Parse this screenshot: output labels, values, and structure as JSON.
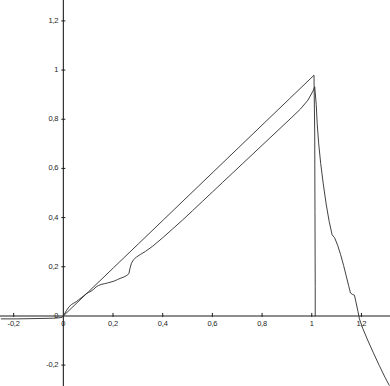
{
  "chart_data": {
    "type": "line",
    "title": "",
    "subtitle": "",
    "xlabel": "",
    "ylabel": "",
    "xlim": [
      -0.255,
      1.315
    ],
    "ylim": [
      -0.285,
      1.285
    ],
    "grid": false,
    "legend": null,
    "decimal_separator": ",",
    "x_ticks": [
      -0.2,
      0,
      0.2,
      0.4,
      0.6,
      0.8,
      1,
      1.2
    ],
    "x_tick_labels": [
      "-0,2",
      "0",
      "0,2",
      "0,4",
      "0,6",
      "0,8",
      "1",
      "1,2"
    ],
    "y_ticks": [
      -0.2,
      0,
      0.2,
      0.4,
      0.6,
      0.8,
      1,
      1.2
    ],
    "y_tick_labels": [
      "-0,2",
      "0",
      "0,2",
      "0,4",
      "0,6",
      "0,8",
      "1",
      "1,2"
    ],
    "series": [
      {
        "name": "reference-line",
        "color": "#2b2b2b",
        "width": 0.9,
        "points": [
          [
            0,
            0
          ],
          [
            0.101,
            0.098
          ],
          [
            0.202,
            0.196
          ],
          [
            0.303,
            0.294
          ],
          [
            0.404,
            0.392
          ],
          [
            0.505,
            0.49
          ],
          [
            0.606,
            0.588
          ],
          [
            0.707,
            0.686
          ],
          [
            0.808,
            0.784
          ],
          [
            0.909,
            0.882
          ],
          [
            1.009,
            0.979
          ],
          [
            1.012,
            0.74
          ],
          [
            1.013,
            0.42
          ],
          [
            1.014,
            0.12
          ],
          [
            1.014,
            0.0
          ]
        ]
      },
      {
        "name": "empirical-curve",
        "color": "#2b2b2b",
        "width": 0.9,
        "points": [
          [
            -0.25,
            -0.012
          ],
          [
            -0.19,
            -0.012
          ],
          [
            -0.13,
            -0.011
          ],
          [
            -0.07,
            -0.01
          ],
          [
            -0.03,
            -0.009
          ],
          [
            -0.005,
            -0.006
          ],
          [
            0.0,
            0.0
          ],
          [
            0.012,
            0.021
          ],
          [
            0.022,
            0.036
          ],
          [
            0.032,
            0.046
          ],
          [
            0.042,
            0.052
          ],
          [
            0.052,
            0.058
          ],
          [
            0.062,
            0.066
          ],
          [
            0.072,
            0.074
          ],
          [
            0.082,
            0.082
          ],
          [
            0.092,
            0.09
          ],
          [
            0.102,
            0.096
          ],
          [
            0.112,
            0.101
          ],
          [
            0.122,
            0.108
          ],
          [
            0.132,
            0.118
          ],
          [
            0.142,
            0.124
          ],
          [
            0.152,
            0.128
          ],
          [
            0.165,
            0.131
          ],
          [
            0.178,
            0.134
          ],
          [
            0.192,
            0.138
          ],
          [
            0.205,
            0.142
          ],
          [
            0.218,
            0.148
          ],
          [
            0.232,
            0.154
          ],
          [
            0.245,
            0.159
          ],
          [
            0.256,
            0.165
          ],
          [
            0.264,
            0.172
          ],
          [
            0.268,
            0.192
          ],
          [
            0.274,
            0.214
          ],
          [
            0.282,
            0.228
          ],
          [
            0.295,
            0.24
          ],
          [
            0.31,
            0.25
          ],
          [
            0.33,
            0.262
          ],
          [
            0.36,
            0.284
          ],
          [
            0.4,
            0.318
          ],
          [
            0.44,
            0.354
          ],
          [
            0.48,
            0.39
          ],
          [
            0.52,
            0.428
          ],
          [
            0.56,
            0.466
          ],
          [
            0.6,
            0.504
          ],
          [
            0.64,
            0.542
          ],
          [
            0.68,
            0.58
          ],
          [
            0.72,
            0.618
          ],
          [
            0.76,
            0.656
          ],
          [
            0.8,
            0.694
          ],
          [
            0.84,
            0.732
          ],
          [
            0.88,
            0.77
          ],
          [
            0.92,
            0.808
          ],
          [
            0.955,
            0.842
          ],
          [
            0.985,
            0.878
          ],
          [
            1.005,
            0.915
          ],
          [
            1.012,
            0.932
          ],
          [
            1.018,
            0.86
          ],
          [
            1.022,
            0.78
          ],
          [
            1.028,
            0.7
          ],
          [
            1.036,
            0.62
          ],
          [
            1.046,
            0.54
          ],
          [
            1.058,
            0.455
          ],
          [
            1.07,
            0.385
          ],
          [
            1.082,
            0.33
          ],
          [
            1.092,
            0.318
          ],
          [
            1.104,
            0.288
          ],
          [
            1.116,
            0.25
          ],
          [
            1.128,
            0.206
          ],
          [
            1.138,
            0.166
          ],
          [
            1.148,
            0.125
          ],
          [
            1.156,
            0.093
          ],
          [
            1.163,
            0.088
          ],
          [
            1.172,
            0.084
          ],
          [
            1.178,
            0.056
          ],
          [
            1.186,
            0.018
          ],
          [
            1.192,
            -0.012
          ],
          [
            1.205,
            -0.05
          ],
          [
            1.225,
            -0.098
          ],
          [
            1.248,
            -0.15
          ],
          [
            1.272,
            -0.202
          ],
          [
            1.295,
            -0.25
          ],
          [
            1.312,
            -0.282
          ]
        ]
      }
    ]
  },
  "axes": {
    "x_axis_name": "horizontal-axis",
    "y_axis_name": "vertical-axis"
  }
}
